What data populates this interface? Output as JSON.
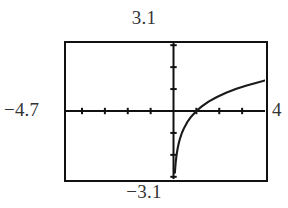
{
  "screen": {
    "type": "graphing-calculator-screen",
    "background_color": "#ffffff",
    "frame_color": "#111111",
    "curve_color": "#1a1a1a",
    "label_color": "#333333"
  },
  "labels": {
    "top": "3.1",
    "bottom": "−3.1",
    "left": "−4.7",
    "right": "4"
  },
  "chart_data": {
    "type": "line",
    "title": "",
    "xlabel": "",
    "ylabel": "",
    "xlim": [
      -4.7,
      4
    ],
    "ylim": [
      -3.1,
      3.1
    ],
    "grid": false,
    "legend": "none",
    "axes": {
      "x_axis_at_y": 0,
      "y_axis_at_x": 0,
      "x_tick_interval": 1,
      "y_tick_interval": 1,
      "x_ticks": [
        -4,
        -3,
        -2,
        -1,
        1,
        2,
        3
      ],
      "y_ticks": [
        -3,
        -2,
        -1,
        1,
        2,
        3
      ]
    },
    "annotations": [
      "vertical asymptote near x = 0",
      "curve increases and flattens toward the right edge"
    ],
    "series": [
      {
        "name": "y = ln(x)",
        "x": [
          0.06,
          0.08,
          0.1,
          0.13,
          0.17,
          0.22,
          0.28,
          0.37,
          0.47,
          0.6,
          0.78,
          1.0,
          1.25,
          1.55,
          1.9,
          2.3,
          2.75,
          3.2,
          3.6,
          4.0
        ],
        "y": [
          -2.81,
          -2.53,
          -2.3,
          -2.04,
          -1.77,
          -1.51,
          -1.27,
          -0.99,
          -0.76,
          -0.51,
          -0.25,
          0.0,
          0.22,
          0.44,
          0.64,
          0.83,
          1.01,
          1.16,
          1.28,
          1.39
        ]
      }
    ]
  }
}
